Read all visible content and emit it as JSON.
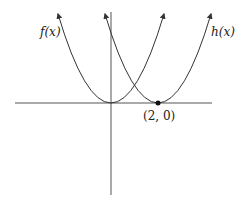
{
  "diagram": {
    "type": "function-graph",
    "axes": {
      "x_axis": true,
      "y_axis": true,
      "ticks": false
    },
    "curves": [
      {
        "name": "f",
        "label": "f(x)",
        "vertex": [
          0,
          0
        ],
        "shape": "upward parabola",
        "color": "#333333"
      },
      {
        "name": "h",
        "label": "h(x)",
        "vertex": [
          2,
          0
        ],
        "shape": "upward parabola",
        "color": "#333333"
      }
    ],
    "points": [
      {
        "coords": [
          2,
          0
        ],
        "label": "(2, 0)"
      }
    ]
  },
  "labels": {
    "f": "f(x)",
    "h": "h(x)",
    "point": "(2, 0)"
  }
}
